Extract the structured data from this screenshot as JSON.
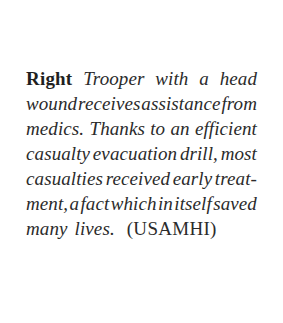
{
  "page": {
    "background_color": "#ffffff",
    "ink_color": "#2b2b2b",
    "lead_in_color": "#1f1f1f"
  },
  "caption": {
    "lead_in": "Right",
    "full_text": "Right Trooper with a head wound receives assistance from medics. Thanks to an efficient casualty evacuation drill, most casualties received early treatment, a fact which in itself saved many lives. (USAMHI)",
    "credit": "(USAMHI)",
    "lines": [
      {
        "words": [
          "Trooper",
          "with",
          "a",
          "head"
        ],
        "justified": true,
        "has_lead_in": true
      },
      {
        "words": [
          "wound",
          "receives",
          "assistance",
          "from"
        ],
        "justified": true,
        "has_lead_in": false
      },
      {
        "words": [
          "medics.",
          "Thanks",
          "to",
          "an",
          "efficient"
        ],
        "justified": true,
        "has_lead_in": false
      },
      {
        "words": [
          "casualty",
          "evacuation",
          "drill,",
          "most"
        ],
        "justified": true,
        "has_lead_in": false
      },
      {
        "words": [
          "casualties",
          "received",
          "early",
          "treat-"
        ],
        "justified": true,
        "has_lead_in": false
      },
      {
        "words": [
          "ment,",
          "a",
          "fact",
          "which",
          "in",
          "itself",
          "saved"
        ],
        "justified": true,
        "has_lead_in": false
      },
      {
        "words": [
          "many",
          "lives."
        ],
        "justified": false,
        "has_lead_in": false,
        "trailing_credit": "(USAMHI)"
      }
    ]
  }
}
